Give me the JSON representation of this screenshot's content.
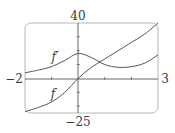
{
  "chart_data": {
    "type": "line",
    "title": "",
    "xlabel": "",
    "ylabel": "",
    "xlim": [
      -2,
      3
    ],
    "ylim": [
      -25,
      40
    ],
    "grid": false,
    "x_tick_labels": [
      "-2",
      "3"
    ],
    "y_tick_labels": [
      "40",
      "-25"
    ],
    "x_ticks": [
      -1,
      0,
      1,
      2
    ],
    "y_ticks": [
      -20,
      -10,
      10,
      20,
      30
    ],
    "series": [
      {
        "name": "f'",
        "x": [
          -2,
          -1.5,
          -1,
          -0.5,
          0,
          0.5,
          1,
          1.5,
          2,
          2.5,
          3
        ],
        "values": [
          4,
          6,
          8.5,
          13,
          18,
          15,
          10,
          8,
          8.5,
          11,
          17
        ]
      },
      {
        "name": "f",
        "x": [
          -2,
          -1.5,
          -1,
          -0.5,
          0,
          0.5,
          1,
          1.5,
          2,
          2.5,
          3
        ],
        "values": [
          -24,
          -21,
          -17,
          -10,
          0,
          8,
          14,
          20,
          26,
          32,
          40
        ]
      }
    ],
    "annotations": [
      {
        "text": "f'",
        "x": -1.3,
        "y": 14
      },
      {
        "text": "f",
        "x": -1.3,
        "y": -12
      }
    ]
  },
  "labels": {
    "y_max": "40",
    "y_min": "−25",
    "x_min": "−2",
    "x_max": "3",
    "f_prime": "f′",
    "f": "f"
  }
}
